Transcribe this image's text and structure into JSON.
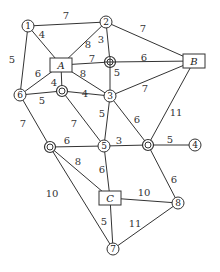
{
  "diagram": {
    "type": "weighted-network-graph",
    "nodes": [
      {
        "id": "1",
        "label": "1",
        "shape": "circle",
        "x": 28,
        "y": 26
      },
      {
        "id": "2",
        "label": "2",
        "shape": "circle",
        "x": 106,
        "y": 22
      },
      {
        "id": "A",
        "label": "A",
        "shape": "box",
        "x": 61,
        "y": 65
      },
      {
        "id": "B",
        "label": "B",
        "shape": "box",
        "x": 194,
        "y": 61
      },
      {
        "id": "P",
        "label": "",
        "shape": "crosshair-circle",
        "x": 110,
        "y": 62
      },
      {
        "id": "6",
        "label": "6",
        "shape": "circle",
        "x": 20,
        "y": 95
      },
      {
        "id": "Q",
        "label": "",
        "shape": "double-circle",
        "x": 62,
        "y": 91
      },
      {
        "id": "3",
        "label": "3",
        "shape": "circle",
        "x": 110,
        "y": 96
      },
      {
        "id": "R",
        "label": "",
        "shape": "double-circle",
        "x": 50,
        "y": 147
      },
      {
        "id": "5",
        "label": "5",
        "shape": "circle",
        "x": 104,
        "y": 146
      },
      {
        "id": "S",
        "label": "",
        "shape": "double-circle",
        "x": 148,
        "y": 145
      },
      {
        "id": "4",
        "label": "4",
        "shape": "circle",
        "x": 195,
        "y": 145
      },
      {
        "id": "C",
        "label": "C",
        "shape": "box",
        "x": 110,
        "y": 198
      },
      {
        "id": "8",
        "label": "8",
        "shape": "circle",
        "x": 178,
        "y": 203
      },
      {
        "id": "7",
        "label": "7",
        "shape": "circle",
        "x": 113,
        "y": 249
      }
    ],
    "edges": [
      {
        "from": "1",
        "to": "2",
        "weight": "7",
        "lx": 66,
        "ly": 19
      },
      {
        "from": "1",
        "to": "A",
        "weight": "4",
        "lx": 42,
        "ly": 38
      },
      {
        "from": "1",
        "to": "6",
        "weight": "5",
        "lx": 12,
        "ly": 63
      },
      {
        "from": "2",
        "to": "A",
        "weight": "8",
        "lx": 88,
        "ly": 48
      },
      {
        "from": "2",
        "to": "P",
        "weight": "3",
        "lx": 101,
        "ly": 43
      },
      {
        "from": "2",
        "to": "B",
        "weight": "7",
        "lx": 143,
        "ly": 32
      },
      {
        "from": "A",
        "to": "P",
        "weight": "7",
        "lx": 92,
        "ly": 62
      },
      {
        "from": "P",
        "to": "B",
        "weight": "6",
        "lx": 144,
        "ly": 61
      },
      {
        "from": "P",
        "to": "3",
        "weight": "5",
        "lx": 117,
        "ly": 76
      },
      {
        "from": "A",
        "to": "6",
        "weight": "6",
        "lx": 38,
        "ly": 77
      },
      {
        "from": "A",
        "to": "Q",
        "weight": "4",
        "lx": 54,
        "ly": 86
      },
      {
        "from": "A",
        "to": "3",
        "weight": "8",
        "lx": 83,
        "ly": 77
      },
      {
        "from": "6",
        "to": "Q",
        "weight": "5",
        "lx": 42,
        "ly": 104
      },
      {
        "from": "Q",
        "to": "3",
        "weight": "4",
        "lx": 85,
        "ly": 97
      },
      {
        "from": "3",
        "to": "B",
        "weight": "7",
        "lx": 145,
        "ly": 92
      },
      {
        "from": "6",
        "to": "R",
        "weight": "7",
        "lx": 23,
        "ly": 127
      },
      {
        "from": "Q",
        "to": "5",
        "weight": "7",
        "lx": 74,
        "ly": 127
      },
      {
        "from": "3",
        "to": "5",
        "weight": "5",
        "lx": 102,
        "ly": 117
      },
      {
        "from": "3",
        "to": "S",
        "weight": "6",
        "lx": 137,
        "ly": 123
      },
      {
        "from": "B",
        "to": "S",
        "weight": "11",
        "lx": 176,
        "ly": 116
      },
      {
        "from": "R",
        "to": "5",
        "weight": "6",
        "lx": 67,
        "ly": 144
      },
      {
        "from": "5",
        "to": "S",
        "weight": "3",
        "lx": 119,
        "ly": 144
      },
      {
        "from": "S",
        "to": "4",
        "weight": "5",
        "lx": 170,
        "ly": 143
      },
      {
        "from": "R",
        "to": "C",
        "weight": "8",
        "lx": 78,
        "ly": 165
      },
      {
        "from": "5",
        "to": "C",
        "weight": "6",
        "lx": 102,
        "ly": 173
      },
      {
        "from": "S",
        "to": "8",
        "weight": "6",
        "lx": 174,
        "ly": 183
      },
      {
        "from": "R",
        "to": "7",
        "weight": "10",
        "lx": 52,
        "ly": 197
      },
      {
        "from": "C",
        "to": "8",
        "weight": "10",
        "lx": 144,
        "ly": 196
      },
      {
        "from": "C",
        "to": "7",
        "weight": "5",
        "lx": 104,
        "ly": 225
      },
      {
        "from": "8",
        "to": "7",
        "weight": "11",
        "lx": 135,
        "ly": 227
      }
    ]
  }
}
